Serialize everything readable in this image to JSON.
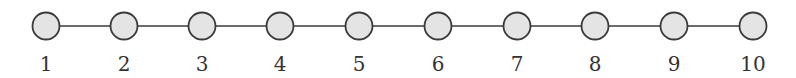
{
  "diagram": {
    "type": "path-graph",
    "colors": {
      "node_fill": "#e4e4e4",
      "node_stroke": "#3a3a3a",
      "edge": "#3a3a3a",
      "label": "#333333"
    },
    "nodes": [
      {
        "id": 1,
        "label": "1",
        "cx": 46
      },
      {
        "id": 2,
        "label": "2",
        "cx": 124
      },
      {
        "id": 3,
        "label": "3",
        "cx": 202
      },
      {
        "id": 4,
        "label": "4",
        "cx": 280
      },
      {
        "id": 5,
        "label": "5",
        "cx": 359
      },
      {
        "id": 6,
        "label": "6",
        "cx": 438
      },
      {
        "id": 7,
        "label": "7",
        "cx": 517
      },
      {
        "id": 8,
        "label": "8",
        "cx": 595
      },
      {
        "id": 9,
        "label": "9",
        "cx": 674
      },
      {
        "id": 10,
        "label": "10",
        "cx": 753
      }
    ],
    "edges": [
      [
        1,
        2
      ],
      [
        2,
        3
      ],
      [
        3,
        4
      ],
      [
        4,
        5
      ],
      [
        5,
        6
      ],
      [
        6,
        7
      ],
      [
        7,
        8
      ],
      [
        8,
        9
      ],
      [
        9,
        10
      ]
    ]
  }
}
